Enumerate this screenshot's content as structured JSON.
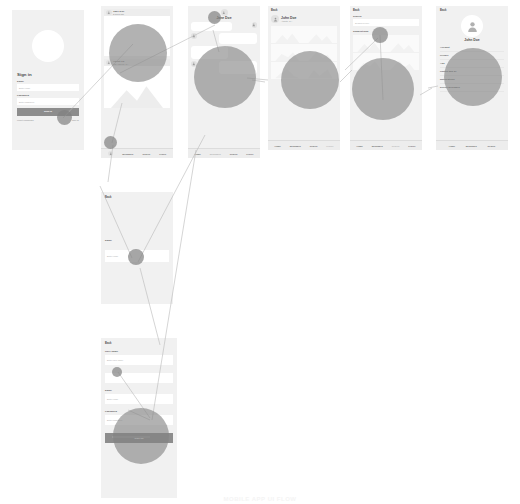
{
  "diagram": {
    "type": "wireframe-user-flow",
    "title_watermark": "MOBILE APP UI FLOW",
    "accent_blob_color": "#828282",
    "screen_bg": "#f1f1f1",
    "field_bg": "#ffffff",
    "button_color": "#8d8d8d"
  },
  "tabbar": {
    "items": [
      "Home",
      "Messages",
      "Search",
      "Profile"
    ]
  },
  "screens": [
    {
      "id": "sign-in",
      "name": "Sign In",
      "title": "Sign in",
      "fields": [
        {
          "label": "Email",
          "value": "Enter email"
        },
        {
          "label": "Password",
          "value": "Enter password"
        }
      ],
      "primary_button": "Sign in",
      "links": [
        "Forgot password?",
        "Sign up"
      ]
    },
    {
      "id": "feed",
      "name": "Feed",
      "cards": [
        {
          "author": "Jane Doe",
          "meta": "2 hours ago"
        },
        {
          "author": "Albert Lu",
          "meta": "Los Angeles, CA"
        }
      ]
    },
    {
      "id": "chat",
      "name": "Chat",
      "title": "Jane Doe",
      "messages": [
        {
          "from": "them",
          "text": "Hey! How are you?"
        },
        {
          "from": "me",
          "text": "Doing great, thanks!"
        },
        {
          "from": "them",
          "text": "Want to meet up later?"
        }
      ]
    },
    {
      "id": "profile-grid",
      "name": "Profile",
      "back": "Back",
      "user": "John Doe",
      "location": "Atlanta, GA",
      "photo_count": 6
    },
    {
      "id": "search",
      "name": "Search",
      "back": "Back",
      "label": "Search",
      "input_placeholder": "Search people",
      "section": "Suggestions"
    },
    {
      "id": "settings",
      "name": "Settings",
      "back": "Back",
      "user": "John Doe",
      "items": [
        "Account",
        "Privacy",
        "Ads",
        "Photos and all",
        "Notifications",
        "Device messages"
      ],
      "tabs": [
        "Home",
        "Messages",
        "Search"
      ]
    },
    {
      "id": "edit-field",
      "name": "Edit Field",
      "back": "Back",
      "label": "Email",
      "input_placeholder": "Enter email"
    },
    {
      "id": "sign-up",
      "name": "Sign Up",
      "back": "Back",
      "fields": [
        {
          "label": "User name",
          "value": "Enter user name"
        },
        {
          "label": "Email",
          "value": "Enter email"
        },
        {
          "label": "Password",
          "value": "Enter password"
        }
      ],
      "primary_button": "Sign up"
    }
  ]
}
